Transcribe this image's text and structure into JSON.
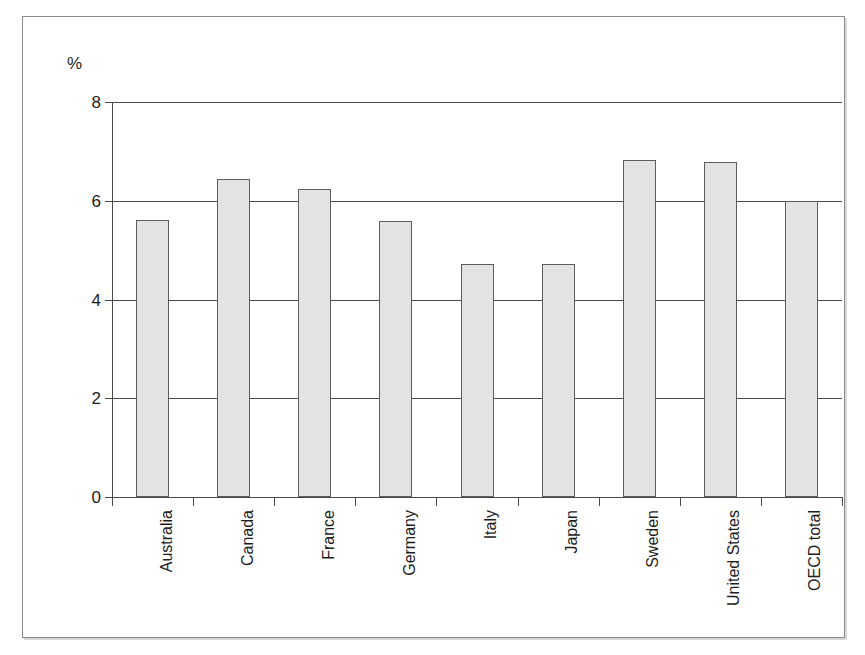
{
  "chart_data": {
    "type": "bar",
    "title": "",
    "subtitle": "",
    "xlabel": "",
    "ylabel": "",
    "unit_label": "%",
    "ylim": [
      0,
      8
    ],
    "ytick_values": [
      0,
      2,
      4,
      6,
      8
    ],
    "ytick_labels": [
      "0",
      "2",
      "4",
      "6",
      "8"
    ],
    "grid": true,
    "grid_axis": "y",
    "legend": false,
    "legend_position": "none",
    "categories": [
      "Australia",
      "Canada",
      "France",
      "Germany",
      "Italy",
      "Japan",
      "Sweden",
      "United States",
      "OECD total"
    ],
    "values": [
      5.62,
      6.44,
      6.24,
      5.6,
      4.71,
      4.71,
      6.83,
      6.79,
      5.99
    ],
    "bar_fill_color": "#e3e3e3",
    "bar_border_color": "#5d5d5d",
    "axis_color": "#4a4a4a",
    "background_color": "#ffffff",
    "frame_color": "#8a8a8a",
    "category_label_rotation": -90
  }
}
